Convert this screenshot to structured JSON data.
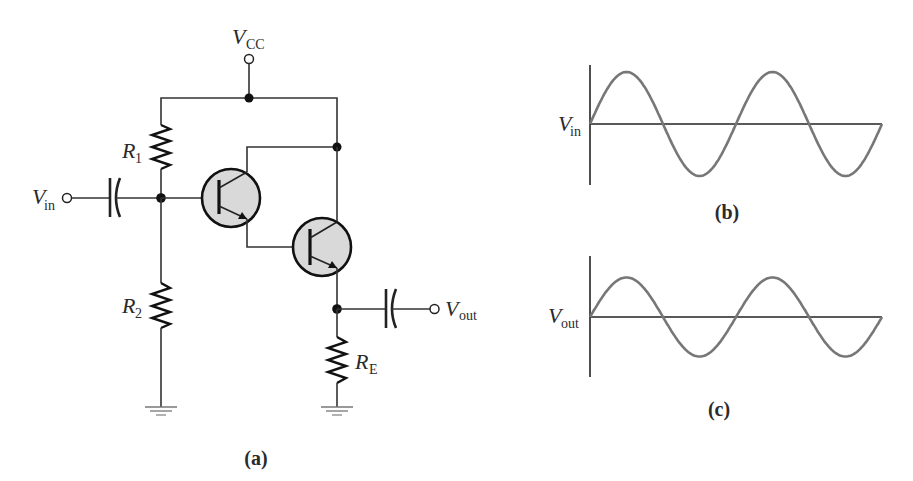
{
  "figure": {
    "type": "Darlington emitter-follower circuit with input/output waveforms",
    "panels": {
      "a": {
        "caption": "(a)"
      },
      "b": {
        "caption": "(b)"
      },
      "c": {
        "caption": "(c)"
      }
    }
  },
  "circuit": {
    "supply": {
      "label_main": "V",
      "label_sub": "CC"
    },
    "input": {
      "label_main": "V",
      "label_sub": "in"
    },
    "output": {
      "label_main": "V",
      "label_sub": "out"
    },
    "resistors": [
      {
        "id": "R1",
        "label_main": "R",
        "label_sub": "1"
      },
      {
        "id": "R2",
        "label_main": "R",
        "label_sub": "2"
      },
      {
        "id": "RE",
        "label_main": "R",
        "label_sub": "E"
      }
    ],
    "capacitors": [
      {
        "id": "C_in",
        "role": "input coupling"
      },
      {
        "id": "C_out",
        "role": "output coupling"
      }
    ],
    "transistors": [
      {
        "id": "Q1",
        "type": "NPN"
      },
      {
        "id": "Q2",
        "type": "NPN"
      }
    ],
    "colors": {
      "wire": "#333333",
      "transistor_fill": "#d9d9d9",
      "wave": "#777777"
    }
  },
  "waveforms": {
    "vin": {
      "label_main": "V",
      "label_sub": "in",
      "cycles": 2,
      "relative_amplitude": 1.0
    },
    "vout": {
      "label_main": "V",
      "label_sub": "out",
      "cycles": 2,
      "relative_amplitude": 0.76
    }
  }
}
